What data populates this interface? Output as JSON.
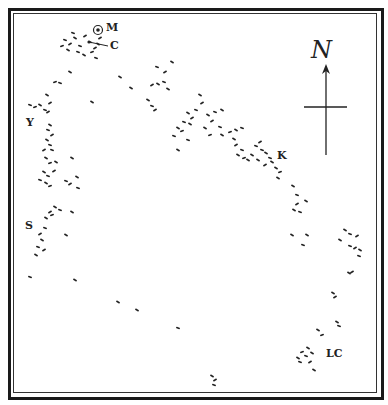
{
  "map": {
    "colors": {
      "ink": "#222222",
      "paper": "#ffffff",
      "frame": "#1a1a1a"
    },
    "compass": {
      "north_label": "N",
      "icon": "north-arrow-cross"
    },
    "labels": [
      {
        "id": "M",
        "text": "M",
        "x": 106,
        "y": 22,
        "symbol": "bullseye"
      },
      {
        "id": "C",
        "text": "C",
        "x": 110,
        "y": 40
      },
      {
        "id": "Y",
        "text": "Y",
        "x": 26,
        "y": 117
      },
      {
        "id": "K",
        "text": "K",
        "x": 277,
        "y": 150
      },
      {
        "id": "S",
        "text": "S",
        "x": 25,
        "y": 220
      },
      {
        "id": "LC",
        "text": "LC",
        "x": 326,
        "y": 348
      }
    ],
    "marks": [
      [
        65,
        40,
        20
      ],
      [
        70,
        44,
        -30
      ],
      [
        75,
        38,
        30
      ],
      [
        80,
        46,
        20
      ],
      [
        62,
        46,
        -20
      ],
      [
        68,
        50,
        30
      ],
      [
        85,
        36,
        -30
      ],
      [
        90,
        42,
        20
      ],
      [
        95,
        48,
        -30
      ],
      [
        78,
        52,
        20
      ],
      [
        84,
        55,
        30
      ],
      [
        92,
        52,
        -20
      ],
      [
        98,
        44,
        30
      ],
      [
        96,
        58,
        20
      ],
      [
        100,
        38,
        -30
      ],
      [
        73,
        33,
        20
      ],
      [
        70,
        72,
        30
      ],
      [
        55,
        82,
        -20
      ],
      [
        60,
        83,
        20
      ],
      [
        47,
        95,
        30
      ],
      [
        50,
        103,
        -30
      ],
      [
        30,
        105,
        20
      ],
      [
        35,
        107,
        -20
      ],
      [
        40,
        105,
        30
      ],
      [
        45,
        110,
        20
      ],
      [
        48,
        112,
        -30
      ],
      [
        92,
        102,
        30
      ],
      [
        120,
        77,
        30
      ],
      [
        131,
        88,
        30
      ],
      [
        157,
        67,
        20
      ],
      [
        165,
        72,
        -30
      ],
      [
        172,
        62,
        30
      ],
      [
        152,
        85,
        -30
      ],
      [
        158,
        84,
        30
      ],
      [
        164,
        82,
        20
      ],
      [
        168,
        89,
        30
      ],
      [
        148,
        100,
        30
      ],
      [
        152,
        106,
        20
      ],
      [
        155,
        110,
        -30
      ],
      [
        50,
        125,
        30
      ],
      [
        48,
        130,
        20
      ],
      [
        52,
        135,
        -30
      ],
      [
        47,
        140,
        30
      ],
      [
        50,
        145,
        20
      ],
      [
        44,
        150,
        -30
      ],
      [
        52,
        150,
        20
      ],
      [
        46,
        158,
        30
      ],
      [
        50,
        163,
        -20
      ],
      [
        56,
        162,
        30
      ],
      [
        44,
        172,
        30
      ],
      [
        48,
        176,
        20
      ],
      [
        54,
        171,
        -30
      ],
      [
        40,
        180,
        20
      ],
      [
        46,
        183,
        30
      ],
      [
        50,
        186,
        -20
      ],
      [
        72,
        158,
        30
      ],
      [
        66,
        181,
        20
      ],
      [
        70,
        184,
        -30
      ],
      [
        77,
        177,
        30
      ],
      [
        78,
        188,
        20
      ],
      [
        55,
        207,
        30
      ],
      [
        50,
        212,
        -30
      ],
      [
        60,
        210,
        20
      ],
      [
        46,
        218,
        30
      ],
      [
        52,
        215,
        -20
      ],
      [
        72,
        212,
        30
      ],
      [
        45,
        228,
        20
      ],
      [
        40,
        234,
        -30
      ],
      [
        42,
        240,
        30
      ],
      [
        38,
        247,
        20
      ],
      [
        44,
        250,
        -30
      ],
      [
        36,
        255,
        30
      ],
      [
        66,
        235,
        30
      ],
      [
        30,
        277,
        20
      ],
      [
        75,
        280,
        30
      ],
      [
        118,
        302,
        30
      ],
      [
        137,
        310,
        30
      ],
      [
        178,
        328,
        20
      ],
      [
        212,
        376,
        30
      ],
      [
        215,
        380,
        -30
      ],
      [
        214,
        385,
        20
      ],
      [
        200,
        95,
        30
      ],
      [
        202,
        103,
        -30
      ],
      [
        196,
        110,
        20
      ],
      [
        188,
        113,
        30
      ],
      [
        192,
        118,
        -30
      ],
      [
        184,
        122,
        20
      ],
      [
        190,
        124,
        30
      ],
      [
        178,
        128,
        30
      ],
      [
        182,
        131,
        -20
      ],
      [
        174,
        136,
        20
      ],
      [
        208,
        115,
        30
      ],
      [
        212,
        121,
        -30
      ],
      [
        215,
        112,
        20
      ],
      [
        222,
        110,
        30
      ],
      [
        220,
        127,
        20
      ],
      [
        205,
        128,
        30
      ],
      [
        210,
        135,
        -20
      ],
      [
        178,
        150,
        30
      ],
      [
        188,
        140,
        20
      ],
      [
        222,
        135,
        30
      ],
      [
        230,
        132,
        -20
      ],
      [
        236,
        130,
        30
      ],
      [
        242,
        128,
        20
      ],
      [
        234,
        139,
        30
      ],
      [
        236,
        145,
        -30
      ],
      [
        242,
        150,
        20
      ],
      [
        238,
        155,
        30
      ],
      [
        244,
        158,
        -20
      ],
      [
        252,
        155,
        30
      ],
      [
        256,
        146,
        20
      ],
      [
        248,
        160,
        30
      ],
      [
        260,
        142,
        -30
      ],
      [
        262,
        150,
        20
      ],
      [
        258,
        160,
        30
      ],
      [
        266,
        153,
        30
      ],
      [
        270,
        158,
        20
      ],
      [
        265,
        165,
        -30
      ],
      [
        272,
        162,
        30
      ],
      [
        276,
        168,
        30
      ],
      [
        280,
        172,
        -20
      ],
      [
        278,
        178,
        30
      ],
      [
        293,
        186,
        30
      ],
      [
        297,
        195,
        20
      ],
      [
        297,
        204,
        -30
      ],
      [
        294,
        210,
        30
      ],
      [
        300,
        212,
        20
      ],
      [
        306,
        201,
        30
      ],
      [
        292,
        235,
        30
      ],
      [
        307,
        235,
        30
      ],
      [
        303,
        245,
        20
      ],
      [
        345,
        230,
        30
      ],
      [
        350,
        234,
        20
      ],
      [
        357,
        236,
        -30
      ],
      [
        340,
        240,
        30
      ],
      [
        350,
        246,
        20
      ],
      [
        355,
        248,
        -30
      ],
      [
        360,
        250,
        30
      ],
      [
        359,
        256,
        20
      ],
      [
        349,
        273,
        30
      ],
      [
        352,
        272,
        -30
      ],
      [
        333,
        293,
        30
      ],
      [
        335,
        297,
        -30
      ],
      [
        318,
        330,
        30
      ],
      [
        322,
        335,
        -20
      ],
      [
        337,
        322,
        30
      ],
      [
        339,
        326,
        20
      ],
      [
        308,
        348,
        30
      ],
      [
        302,
        352,
        -20
      ],
      [
        298,
        358,
        30
      ],
      [
        306,
        356,
        20
      ],
      [
        312,
        353,
        30
      ],
      [
        300,
        362,
        20
      ],
      [
        310,
        362,
        -30
      ],
      [
        314,
        370,
        30
      ]
    ]
  }
}
